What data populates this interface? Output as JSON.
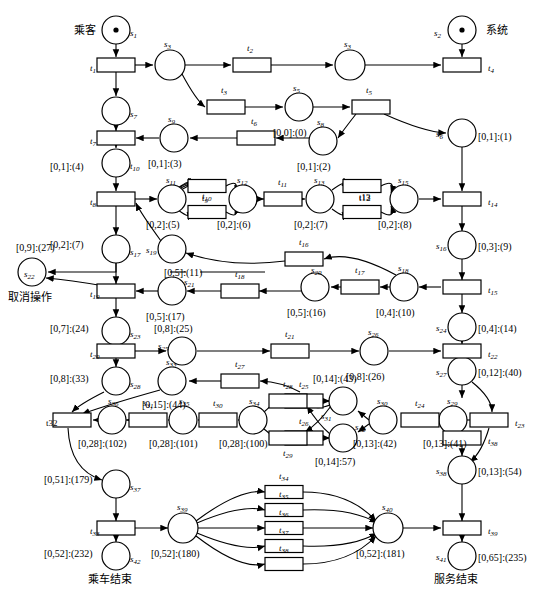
{
  "diagram": {
    "stroke_color": "#000000",
    "fill_color": "#ffffff",
    "width": 544,
    "height": 596
  },
  "annotations": {
    "passenger": "乘客",
    "system": "系统",
    "cancel_operation": "取消操作",
    "ride_end": "乘车结束",
    "service_end": "服务结束"
  },
  "places": [
    {
      "id": "s1",
      "label": "s",
      "sub": "1",
      "cx": 116,
      "cy": 30,
      "r": 14,
      "token": true,
      "name_dx": 14,
      "name_dy": 4,
      "mark": "",
      "mark_dx": 0,
      "mark_dy": 0
    },
    {
      "id": "s2",
      "label": "s",
      "sub": "2",
      "cx": 462,
      "cy": 30,
      "r": 14,
      "token": true,
      "name_dx": -28,
      "name_dy": 4,
      "mark": "",
      "mark_dx": 0,
      "mark_dy": 0
    },
    {
      "id": "s3a",
      "label": "s",
      "sub": "3",
      "cx": 170,
      "cy": 65,
      "r": 15,
      "token": false,
      "name_dx": -6,
      "name_dy": -20,
      "mark": "",
      "mark_dx": 0,
      "mark_dy": 0
    },
    {
      "id": "s3b",
      "label": "s",
      "sub": "3",
      "cx": 350,
      "cy": 65,
      "r": 15,
      "token": false,
      "name_dx": -6,
      "name_dy": -20,
      "mark": "",
      "mark_dx": 0,
      "mark_dy": 0
    },
    {
      "id": "s7",
      "label": "s",
      "sub": "7",
      "cx": 116,
      "cy": 111,
      "r": 14,
      "token": false,
      "name_dx": 14,
      "name_dy": 4,
      "mark": "",
      "mark_dx": 0,
      "mark_dy": 0
    },
    {
      "id": "s5",
      "label": "s",
      "sub": "5",
      "cx": 299,
      "cy": 107,
      "r": 14,
      "token": false,
      "name_dx": -6,
      "name_dy": -18,
      "mark": "[0,0]:(0)",
      "mark_dx": -26,
      "mark_dy": 26
    },
    {
      "id": "s8",
      "label": "s",
      "sub": "8",
      "cx": 323,
      "cy": 141,
      "r": 14,
      "token": false,
      "name_dx": -6,
      "name_dy": -18,
      "mark": "[0,1]:(2)",
      "mark_dx": -26,
      "mark_dy": 26
    },
    {
      "id": "s6",
      "label": "s",
      "sub": "6",
      "cx": 462,
      "cy": 133,
      "r": 14,
      "token": false,
      "name_dx": -26,
      "name_dy": 2,
      "mark": "[0,1]:(1)",
      "mark_dx": 16,
      "mark_dy": 4
    },
    {
      "id": "s9",
      "label": "s",
      "sub": "9",
      "cx": 174,
      "cy": 138,
      "r": 14,
      "token": false,
      "name_dx": -6,
      "name_dy": -18,
      "mark": "[0,1]:(3)",
      "mark_dx": -26,
      "mark_dy": 26
    },
    {
      "id": "s10",
      "label": "t",
      "sub": "10",
      "cx": 116,
      "cy": 163,
      "r": 14,
      "token": false,
      "name_dx": 14,
      "name_dy": 4,
      "mark": "[0,1]:(4)",
      "mark_dx": -66,
      "mark_dy": 4
    },
    {
      "id": "s11",
      "label": "s",
      "sub": "11",
      "cx": 172,
      "cy": 199,
      "r": 14,
      "token": false,
      "name_dx": -6,
      "name_dy": -18,
      "mark": "[0,2]:(5)",
      "mark_dx": -26,
      "mark_dy": 26
    },
    {
      "id": "s12",
      "label": "s",
      "sub": "12",
      "cx": 243,
      "cy": 199,
      "r": 14,
      "token": false,
      "name_dx": -6,
      "name_dy": -18,
      "mark": "[0,2]:(6)",
      "mark_dx": -26,
      "mark_dy": 26
    },
    {
      "id": "s13",
      "label": "s",
      "sub": "13",
      "cx": 320,
      "cy": 199,
      "r": 14,
      "token": false,
      "name_dx": -6,
      "name_dy": -18,
      "mark": "[0,2]:(7)",
      "mark_dx": -26,
      "mark_dy": 26
    },
    {
      "id": "s15",
      "label": "s",
      "sub": "15",
      "cx": 404,
      "cy": 199,
      "r": 14,
      "token": false,
      "name_dx": -6,
      "name_dy": -18,
      "mark": "[0,2]:(8)",
      "mark_dx": -26,
      "mark_dy": 26
    },
    {
      "id": "s17",
      "label": "s",
      "sub": "17",
      "cx": 116,
      "cy": 249,
      "r": 14,
      "token": false,
      "name_dx": 14,
      "name_dy": 4,
      "mark": "[0,2]:(7)",
      "mark_dx": -66,
      "mark_dy": -4
    },
    {
      "id": "s19",
      "label": "s",
      "sub": "19",
      "cx": 172,
      "cy": 249,
      "r": 14,
      "token": false,
      "name_dx": -26,
      "name_dy": 2,
      "mark": "[0,5]:(11)",
      "mark_dx": -8,
      "mark_dy": 24
    },
    {
      "id": "s16",
      "label": "s",
      "sub": "16",
      "cx": 462,
      "cy": 245,
      "r": 14,
      "token": false,
      "name_dx": -26,
      "name_dy": 2,
      "mark": "[0,3]:(9)",
      "mark_dx": 16,
      "mark_dy": 2
    },
    {
      "id": "s18",
      "label": "s",
      "sub": "18",
      "cx": 404,
      "cy": 287,
      "r": 14,
      "token": false,
      "name_dx": -6,
      "name_dy": -18,
      "mark": "[0,4]:(10)",
      "mark_dx": -28,
      "mark_dy": 26
    },
    {
      "id": "s20",
      "label": "s",
      "sub": "20",
      "cx": 315,
      "cy": 287,
      "r": 14,
      "token": false,
      "name_dx": -4,
      "name_dy": -16,
      "mark": "[0,5]:(16)",
      "mark_dx": -28,
      "mark_dy": 26
    },
    {
      "id": "s22",
      "label": "s",
      "sub": "22",
      "cx": 32,
      "cy": 272,
      "r": 14,
      "token": false,
      "name_dx": -8,
      "name_dy": 3,
      "mark": "[0,9]:(27)",
      "mark_dx": -16,
      "mark_dy": -24
    },
    {
      "id": "s21",
      "label": "s",
      "sub": "21",
      "cx": 172,
      "cy": 291,
      "r": 14,
      "token": false,
      "name_dx": 12,
      "name_dy": -8,
      "mark": "[0,5]:(17)",
      "mark_dx": -26,
      "mark_dy": 26
    },
    {
      "id": "s23",
      "label": "s",
      "sub": "23",
      "cx": 116,
      "cy": 331,
      "r": 14,
      "token": false,
      "name_dx": 14,
      "name_dy": 4,
      "mark": "[0,7]:(24)",
      "mark_dx": -66,
      "mark_dy": -2
    },
    {
      "id": "s24",
      "label": "s",
      "sub": "24",
      "cx": 462,
      "cy": 327,
      "r": 14,
      "token": false,
      "name_dx": -26,
      "name_dy": 2,
      "mark": "[0,4]:(14)",
      "mark_dx": 16,
      "mark_dy": 2
    },
    {
      "id": "s25",
      "label": "s",
      "sub": "25",
      "cx": 182,
      "cy": 351,
      "r": 14,
      "token": false,
      "name_dx": -24,
      "name_dy": -4,
      "mark": "[0,8]:(25)",
      "mark_dx": -28,
      "mark_dy": -22
    },
    {
      "id": "s26",
      "label": "s",
      "sub": "26",
      "cx": 374,
      "cy": 351,
      "r": 14,
      "token": false,
      "name_dx": -6,
      "name_dy": -18,
      "mark": "[0,8]:(26)",
      "mark_dx": -28,
      "mark_dy": 26
    },
    {
      "id": "s28",
      "label": "s",
      "sub": "28",
      "cx": 116,
      "cy": 381,
      "r": 14,
      "token": false,
      "name_dx": 14,
      "name_dy": 4,
      "mark": "[0,8]:(33)",
      "mark_dx": -66,
      "mark_dy": -2
    },
    {
      "id": "s33",
      "label": "s",
      "sub": "33",
      "cx": 172,
      "cy": 381,
      "r": 14,
      "token": false,
      "name_dx": -6,
      "name_dy": -18,
      "mark": "[0,15]:(44)",
      "mark_dx": -30,
      "mark_dy": 24
    },
    {
      "id": "s27",
      "label": "s",
      "sub": "27",
      "cx": 462,
      "cy": 371,
      "r": 14,
      "token": false,
      "name_dx": -26,
      "name_dy": 2,
      "mark": "[0,12]:(40)",
      "mark_dx": 16,
      "mark_dy": 2
    },
    {
      "id": "s36",
      "label": "s",
      "sub": "36",
      "cx": 112,
      "cy": 420,
      "r": 14,
      "token": false,
      "name_dx": -4,
      "name_dy": -18,
      "mark": "[0,28]:(102)",
      "mark_dx": -34,
      "mark_dy": 24
    },
    {
      "id": "s35",
      "label": "s",
      "sub": "35",
      "cx": 183,
      "cy": 420,
      "r": 14,
      "token": false,
      "name_dx": -4,
      "name_dy": -18,
      "mark": "[0,28]:(101)",
      "mark_dx": -34,
      "mark_dy": 24
    },
    {
      "id": "s34",
      "label": "s",
      "sub": "34",
      "cx": 253,
      "cy": 420,
      "r": 14,
      "token": false,
      "name_dx": -4,
      "name_dy": -18,
      "mark": "[0,28]:(100)",
      "mark_dx": -34,
      "mark_dy": 24
    },
    {
      "id": "s31",
      "label": "s",
      "sub": "31",
      "cx": 343,
      "cy": 401,
      "r": 14,
      "token": false,
      "name_dx": -22,
      "name_dy": 16,
      "mark": "[0,14]:(43)",
      "mark_dx": -30,
      "mark_dy": -22
    },
    {
      "id": "s32",
      "label": "s",
      "sub": "32",
      "cx": 343,
      "cy": 438,
      "r": 14,
      "token": false,
      "name_dx": 12,
      "name_dy": -10,
      "mark": "[0,14]:57)",
      "mark_dx": -28,
      "mark_dy": 24
    },
    {
      "id": "s30",
      "label": "s",
      "sub": "30",
      "cx": 383,
      "cy": 420,
      "r": 14,
      "token": false,
      "name_dx": -6,
      "name_dy": -18,
      "mark": "[0,13]:(42)",
      "mark_dx": -30,
      "mark_dy": 24
    },
    {
      "id": "s29",
      "label": "s",
      "sub": "29",
      "cx": 453,
      "cy": 420,
      "r": 14,
      "token": false,
      "name_dx": -6,
      "name_dy": -18,
      "mark": "[0,13]:(41)",
      "mark_dx": -30,
      "mark_dy": 24
    },
    {
      "id": "s38",
      "label": "s",
      "sub": "38",
      "cx": 462,
      "cy": 470,
      "r": 14,
      "token": false,
      "name_dx": -26,
      "name_dy": 2,
      "mark": "[0,13]:(54)",
      "mark_dx": 16,
      "mark_dy": 2
    },
    {
      "id": "s37",
      "label": "s",
      "sub": "37",
      "cx": 116,
      "cy": 484,
      "r": 14,
      "token": false,
      "name_dx": 14,
      "name_dy": 4,
      "mark": "[0,51]:(179)",
      "mark_dx": -72,
      "mark_dy": -4
    },
    {
      "id": "s39",
      "label": "s",
      "sub": "39",
      "cx": 183,
      "cy": 528,
      "r": 15,
      "token": false,
      "name_dx": -6,
      "name_dy": -20,
      "mark": "[0,52]:(180)",
      "mark_dx": -32,
      "mark_dy": 26
    },
    {
      "id": "s40",
      "label": "s",
      "sub": "40",
      "cx": 388,
      "cy": 528,
      "r": 15,
      "token": false,
      "name_dx": -6,
      "name_dy": -20,
      "mark": "[0,52]:(181)",
      "mark_dx": -32,
      "mark_dy": 26
    },
    {
      "id": "s42",
      "label": "s",
      "sub": "42",
      "cx": 116,
      "cy": 556,
      "r": 14,
      "token": false,
      "name_dx": 14,
      "name_dy": 4,
      "mark": "[0,52]:(232)",
      "mark_dx": -72,
      "mark_dy": -2
    },
    {
      "id": "s41",
      "label": "s",
      "sub": "41",
      "cx": 462,
      "cy": 556,
      "r": 14,
      "token": false,
      "name_dx": -26,
      "name_dy": 2,
      "mark": "[0,65]:(235)",
      "mark_dx": 16,
      "mark_dy": 2
    }
  ],
  "transitions": [
    {
      "id": "t1",
      "label": "t",
      "sub": "1",
      "cx": 116,
      "cy": 65,
      "w": 38,
      "h": 14,
      "name_dx": -26,
      "name_dy": 4
    },
    {
      "id": "t2",
      "label": "t",
      "sub": "2",
      "cx": 252,
      "cy": 65,
      "w": 38,
      "h": 14,
      "name_dx": -5,
      "name_dy": -16
    },
    {
      "id": "t4",
      "label": "t",
      "sub": "4",
      "cx": 462,
      "cy": 65,
      "w": 38,
      "h": 14,
      "name_dx": 26,
      "name_dy": 4
    },
    {
      "id": "t3",
      "label": "t",
      "sub": "3",
      "cx": 226,
      "cy": 107,
      "w": 38,
      "h": 14,
      "name_dx": -5,
      "name_dy": -16
    },
    {
      "id": "t5",
      "label": "t",
      "sub": "5",
      "cx": 371,
      "cy": 107,
      "w": 38,
      "h": 14,
      "name_dx": -5,
      "name_dy": -16
    },
    {
      "id": "t6",
      "label": "t",
      "sub": "6",
      "cx": 256,
      "cy": 138,
      "w": 38,
      "h": 14,
      "name_dx": -5,
      "name_dy": -16
    },
    {
      "id": "t7",
      "label": "t",
      "sub": "7",
      "cx": 116,
      "cy": 138,
      "w": 38,
      "h": 14,
      "name_dx": -26,
      "name_dy": 4
    },
    {
      "id": "t8",
      "label": "t",
      "sub": "8",
      "cx": 116,
      "cy": 199,
      "w": 38,
      "h": 14,
      "name_dx": -26,
      "name_dy": 4
    },
    {
      "id": "t9",
      "label": "t",
      "sub": "9",
      "cx": 207,
      "cy": 186,
      "w": 38,
      "h": 13,
      "name_dx": -5,
      "name_dy": 13
    },
    {
      "id": "t10",
      "label": "t",
      "sub": "10",
      "cx": 207,
      "cy": 212,
      "w": 38,
      "h": 13,
      "name_dx": -5,
      "name_dy": -15
    },
    {
      "id": "t11",
      "label": "t",
      "sub": "11",
      "cx": 283,
      "cy": 199,
      "w": 38,
      "h": 14,
      "name_dx": -5,
      "name_dy": -16
    },
    {
      "id": "t12",
      "label": "t12",
      "sub": "",
      "cx": 362,
      "cy": 186,
      "w": 38,
      "h": 13,
      "name_dx": -3,
      "name_dy": 13
    },
    {
      "id": "t13",
      "label": "t13",
      "sub": "",
      "cx": 362,
      "cy": 212,
      "w": 38,
      "h": 13,
      "name_dx": -3,
      "name_dy": -14
    },
    {
      "id": "t14",
      "label": "t",
      "sub": "14",
      "cx": 462,
      "cy": 199,
      "w": 38,
      "h": 14,
      "name_dx": 26,
      "name_dy": 4
    },
    {
      "id": "t16",
      "label": "t",
      "sub": "16",
      "cx": 304,
      "cy": 259,
      "w": 38,
      "h": 14,
      "name_dx": -5,
      "name_dy": -16
    },
    {
      "id": "t17",
      "label": "t",
      "sub": "17",
      "cx": 360,
      "cy": 287,
      "w": 38,
      "h": 14,
      "name_dx": -5,
      "name_dy": -16
    },
    {
      "id": "t15",
      "label": "t",
      "sub": "15",
      "cx": 462,
      "cy": 287,
      "w": 38,
      "h": 14,
      "name_dx": 26,
      "name_dy": 4
    },
    {
      "id": "t18",
      "label": "t",
      "sub": "18",
      "cx": 240,
      "cy": 291,
      "w": 38,
      "h": 14,
      "name_dx": -5,
      "name_dy": -16
    },
    {
      "id": "t19",
      "label": "t",
      "sub": "19",
      "cx": 116,
      "cy": 291,
      "w": 38,
      "h": 14,
      "name_dx": -26,
      "name_dy": 4
    },
    {
      "id": "t20",
      "label": "t",
      "sub": "20",
      "cx": 116,
      "cy": 351,
      "w": 38,
      "h": 14,
      "name_dx": -26,
      "name_dy": 4
    },
    {
      "id": "t21",
      "label": "t",
      "sub": "21",
      "cx": 290,
      "cy": 351,
      "w": 38,
      "h": 14,
      "name_dx": -5,
      "name_dy": -16
    },
    {
      "id": "t22",
      "label": "t",
      "sub": "22",
      "cx": 462,
      "cy": 351,
      "w": 38,
      "h": 14,
      "name_dx": 26,
      "name_dy": 4
    },
    {
      "id": "t27",
      "label": "t",
      "sub": "27",
      "cx": 240,
      "cy": 381,
      "w": 38,
      "h": 14,
      "name_dx": -5,
      "name_dy": -16
    },
    {
      "id": "t25",
      "label": "t",
      "sub": "25",
      "cx": 304,
      "cy": 401,
      "w": 38,
      "h": 14,
      "name_dx": -5,
      "name_dy": -16
    },
    {
      "id": "t26",
      "label": "t",
      "sub": "26",
      "cx": 304,
      "cy": 438,
      "w": 38,
      "h": 14,
      "name_dx": -5,
      "name_dy": -16
    },
    {
      "id": "t24",
      "label": "t",
      "sub": "24",
      "cx": 420,
      "cy": 420,
      "w": 38,
      "h": 14,
      "name_dx": -5,
      "name_dy": -16
    },
    {
      "id": "t23",
      "label": "t",
      "sub": "23",
      "cx": 489,
      "cy": 420,
      "w": 38,
      "h": 14,
      "name_dx": 26,
      "name_dy": 4
    },
    {
      "id": "t28",
      "label": "t",
      "sub": "28",
      "cx": 288,
      "cy": 401,
      "w": 38,
      "h": 14,
      "name_dx": -5,
      "name_dy": -16
    },
    {
      "id": "t29",
      "label": "t",
      "sub": "29",
      "cx": 288,
      "cy": 438,
      "w": 38,
      "h": 14,
      "name_dx": -5,
      "name_dy": 16
    },
    {
      "id": "t30",
      "label": "t",
      "sub": "30",
      "cx": 218,
      "cy": 420,
      "w": 38,
      "h": 14,
      "name_dx": -5,
      "name_dy": -16
    },
    {
      "id": "t31s",
      "label": "s",
      "sub": "31",
      "cx": 148,
      "cy": 420,
      "w": 38,
      "h": 14,
      "name_dx": -5,
      "name_dy": -16
    },
    {
      "id": "t32",
      "label": "t32",
      "sub": "",
      "cx": 72,
      "cy": 420,
      "w": 38,
      "h": 14,
      "name_dx": -26,
      "name_dy": 4
    },
    {
      "id": "t38",
      "label": "t",
      "sub": "38",
      "cx": 462,
      "cy": 438,
      "w": 38,
      "h": 14,
      "name_dx": 26,
      "name_dy": 4
    },
    {
      "id": "t33",
      "label": "t",
      "sub": "33",
      "cx": 116,
      "cy": 528,
      "w": 38,
      "h": 14,
      "name_dx": -26,
      "name_dy": 4
    },
    {
      "id": "t34",
      "label": "t",
      "sub": "34",
      "cx": 284,
      "cy": 492,
      "w": 38,
      "h": 13,
      "name_dx": -5,
      "name_dy": -15
    },
    {
      "id": "t35",
      "label": "t",
      "sub": "35",
      "cx": 284,
      "cy": 510,
      "w": 38,
      "h": 13,
      "name_dx": -5,
      "name_dy": -15
    },
    {
      "id": "t36",
      "label": "t",
      "sub": "36",
      "cx": 284,
      "cy": 528,
      "w": 38,
      "h": 13,
      "name_dx": -5,
      "name_dy": -15
    },
    {
      "id": "t37",
      "label": "t",
      "sub": "37",
      "cx": 284,
      "cy": 546,
      "w": 38,
      "h": 13,
      "name_dx": -5,
      "name_dy": -15
    },
    {
      "id": "t38b",
      "label": "t",
      "sub": "38",
      "cx": 284,
      "cy": 564,
      "w": 38,
      "h": 13,
      "name_dx": -5,
      "name_dy": -15
    },
    {
      "id": "t39",
      "label": "t",
      "sub": "39",
      "cx": 462,
      "cy": 528,
      "w": 38,
      "h": 14,
      "name_dx": 26,
      "name_dy": 4
    },
    {
      "id": "t39b",
      "label": "t",
      "sub": "39",
      "cx": 0,
      "cy": 0,
      "w": 0,
      "h": 0,
      "name_dx": 0,
      "name_dy": 0
    }
  ],
  "text_labels": [
    {
      "text": "乘客",
      "x": 74,
      "y": 25,
      "cjk": true
    },
    {
      "text": "系统",
      "x": 486,
      "y": 25,
      "cjk": true
    },
    {
      "text": "取消操作",
      "x": 8,
      "y": 292,
      "cjk": true
    },
    {
      "text": "乘车结束",
      "x": 88,
      "y": 574,
      "cjk": true
    },
    {
      "text": "服务结束",
      "x": 434,
      "y": 574,
      "cjk": true
    }
  ]
}
